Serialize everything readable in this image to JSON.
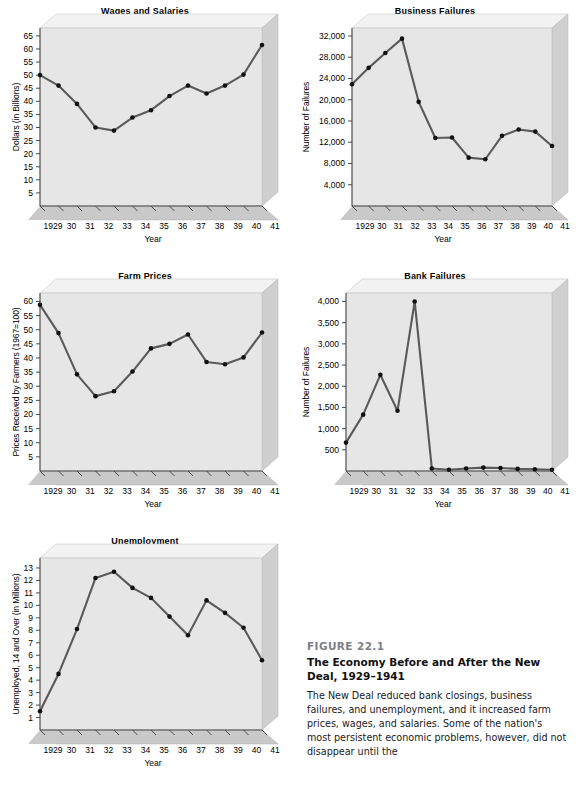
{
  "figure": {
    "number": "FIGURE 22.1",
    "title": "The Economy Before and After the New Deal, 1929–1941",
    "body": "The New Deal reduced bank closings, business failures, and unemployment, and it increased farm prices, wages, and salaries. Some of the nation's most persistent economic problems, however, did not disappear until the"
  },
  "shared": {
    "xlabel": "Year",
    "xtick_labels": [
      "1929",
      "30",
      "31",
      "32",
      "33",
      "34",
      "35",
      "36",
      "37",
      "38",
      "39",
      "40",
      "41"
    ],
    "years": [
      1929,
      1930,
      1931,
      1932,
      1933,
      1934,
      1935,
      1936,
      1937,
      1938,
      1939,
      1940,
      1941
    ]
  },
  "chart_data": [
    {
      "type": "line",
      "id": "wages-and-salaries",
      "title": "Wages and Salaries",
      "xlabel": "Year",
      "ylabel": "Dollars (in Billions)",
      "categories": [
        "1929",
        "30",
        "31",
        "32",
        "33",
        "34",
        "35",
        "36",
        "37",
        "38",
        "39",
        "40",
        "41"
      ],
      "values": [
        50.0,
        46.0,
        39.0,
        30.0,
        28.8,
        33.8,
        36.6,
        42.0,
        46.0,
        43.0,
        46.0,
        50.2,
        61.5
      ],
      "ylim": [
        0,
        68
      ],
      "yticks": [
        5,
        10,
        15,
        20,
        25,
        30,
        35,
        40,
        45,
        50,
        55,
        60,
        65
      ],
      "ytick_labels": [
        "5",
        "10",
        "15",
        "20",
        "25",
        "30",
        "35",
        "40",
        "45",
        "50",
        "55",
        "60",
        "65"
      ],
      "grid": false,
      "legend": "none"
    },
    {
      "type": "line",
      "id": "business-failures",
      "title": "Business Failures",
      "xlabel": "Year",
      "ylabel": "Number of Failures",
      "categories": [
        "1929",
        "30",
        "31",
        "32",
        "33",
        "34",
        "35",
        "36",
        "37",
        "38",
        "39",
        "40",
        "41"
      ],
      "values": [
        22900,
        26000,
        28800,
        31500,
        19600,
        12800,
        12900,
        9100,
        8800,
        13200,
        14400,
        14000,
        11300
      ],
      "ylim": [
        0,
        33500
      ],
      "yticks": [
        4000,
        8000,
        12000,
        16000,
        20000,
        24000,
        28000,
        32000
      ],
      "ytick_labels": [
        "4,000",
        "8,000",
        "12,000",
        "16,000",
        "20,000",
        "24,000",
        "28,000",
        "32,000"
      ],
      "grid": false,
      "legend": "none"
    },
    {
      "type": "line",
      "id": "farm-prices",
      "title": "Farm Prices",
      "xlabel": "Year",
      "ylabel": "Prices Received by Farmers (1967=100)",
      "categories": [
        "1929",
        "30",
        "31",
        "32",
        "33",
        "34",
        "35",
        "36",
        "37",
        "38",
        "39",
        "40",
        "41"
      ],
      "values": [
        58.8,
        48.8,
        34.2,
        26.5,
        28.2,
        35.2,
        43.4,
        45.0,
        48.3,
        38.6,
        37.8,
        40.2,
        49.0
      ],
      "ylim": [
        0,
        63
      ],
      "yticks": [
        5,
        10,
        15,
        20,
        25,
        30,
        35,
        40,
        45,
        50,
        55,
        60
      ],
      "ytick_labels": [
        "5",
        "10",
        "15",
        "20",
        "25",
        "30",
        "35",
        "40",
        "45",
        "50",
        "55",
        "60"
      ],
      "grid": false,
      "legend": "none"
    },
    {
      "type": "line",
      "id": "bank-failures",
      "title": "Bank Failures",
      "xlabel": "Year",
      "ylabel": "Number of Failures",
      "categories": [
        "1929",
        "30",
        "31",
        "32",
        "33",
        "34",
        "35",
        "36",
        "37",
        "38",
        "39",
        "40",
        "41"
      ],
      "values": [
        670,
        1330,
        2270,
        1420,
        4000,
        60,
        30,
        60,
        80,
        70,
        50,
        40,
        30
      ],
      "ylim": [
        0,
        4200
      ],
      "yticks": [
        500,
        1000,
        1500,
        2000,
        2500,
        3000,
        3500,
        4000
      ],
      "ytick_labels": [
        "500",
        "1,000",
        "1,500",
        "2,000",
        "2,500",
        "3,000",
        "3,500",
        "4,000"
      ],
      "grid": false,
      "legend": "none"
    },
    {
      "type": "line",
      "id": "unemployment",
      "title": "Unemployment",
      "xlabel": "Year",
      "ylabel": "Unemployed, 14 and Over (in Millions)",
      "categories": [
        "1929",
        "30",
        "31",
        "32",
        "33",
        "34",
        "35",
        "36",
        "37",
        "38",
        "39",
        "40",
        "41"
      ],
      "values": [
        1.5,
        4.5,
        8.1,
        12.2,
        12.7,
        11.4,
        10.6,
        9.1,
        7.6,
        10.4,
        9.4,
        8.2,
        5.6
      ],
      "ylim": [
        0,
        13.8
      ],
      "yticks": [
        1,
        2,
        3,
        4,
        5,
        6,
        7,
        8,
        9,
        10,
        11,
        12,
        13
      ],
      "ytick_labels": [
        "1",
        "2",
        "3",
        "4",
        "5",
        "6",
        "7",
        "8",
        "9",
        "10",
        "11",
        "12",
        "13"
      ],
      "grid": false,
      "legend": "none"
    }
  ],
  "style": {
    "plot_bg": "#e6e6e6",
    "side_panel": "#cfcfcf",
    "base_panel": "#c9c9c9",
    "line_color": "#5a5a5a",
    "marker_color": "#111111",
    "axis_color": "#4a4a4a"
  }
}
